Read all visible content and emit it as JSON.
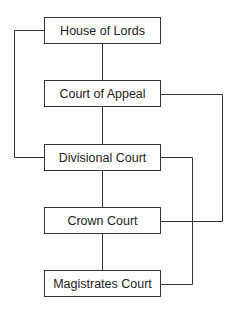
{
  "diagram": {
    "type": "hierarchy",
    "nodes": [
      {
        "id": "hol",
        "label": "House of Lords"
      },
      {
        "id": "coa",
        "label": "Court of Appeal"
      },
      {
        "id": "div",
        "label": "Divisional Court"
      },
      {
        "id": "crown",
        "label": "Crown Court"
      },
      {
        "id": "mag",
        "label": "Magistrates Court"
      }
    ],
    "edges": [
      {
        "from": "hol",
        "to": "coa"
      },
      {
        "from": "coa",
        "to": "div"
      },
      {
        "from": "div",
        "to": "crown"
      },
      {
        "from": "crown",
        "to": "mag"
      },
      {
        "from": "hol",
        "to": "div",
        "route": "left"
      },
      {
        "from": "coa",
        "to": "crown",
        "route": "right-outer"
      },
      {
        "from": "div",
        "to": "mag",
        "route": "right-inner"
      }
    ]
  }
}
